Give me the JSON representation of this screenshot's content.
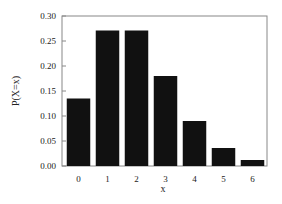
{
  "chart_data": {
    "type": "bar",
    "title": "",
    "xlabel": "x",
    "ylabel": "P(X=x)",
    "categories": [
      "0",
      "1",
      "2",
      "3",
      "4",
      "5",
      "6"
    ],
    "values": [
      0.135,
      0.271,
      0.271,
      0.18,
      0.09,
      0.036,
      0.012
    ],
    "ylim": [
      0,
      0.3
    ],
    "yticks": [
      "0.00",
      "0.05",
      "0.10",
      "0.15",
      "0.20",
      "0.25",
      "0.30"
    ],
    "grid": false,
    "legend": null,
    "bar_color": "#111111"
  }
}
